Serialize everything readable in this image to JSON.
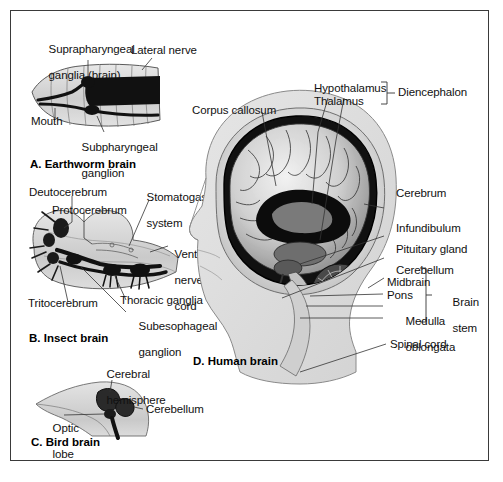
{
  "figure": {
    "title_note": "Comparative brain anatomy across four species",
    "background_color": "#ffffff",
    "border_color": "#3a3a3a"
  },
  "panels": {
    "earthworm": {
      "caption": "A. Earthworm brain",
      "labels": {
        "suprapharyngeal_line1": "Suprapharyngeal",
        "suprapharyngeal_line2": "ganglia (brain)",
        "lateral_nerve": "Lateral nerve",
        "mouth": "Mouth",
        "subpharyngeal_line1": "Subpharyngeal",
        "subpharyngeal_line2": "ganglion"
      }
    },
    "insect": {
      "caption": "B. Insect brain",
      "labels": {
        "deutocerebrum": "Deutocerebrum",
        "protocerebrum": "Protocerebrum",
        "stomatogastric_line1": "Stomatogastric",
        "stomatogastric_line2": "system",
        "ventral_line1": "Ventral",
        "ventral_line2": "nerve",
        "ventral_line3": "cord",
        "tritocerebrum": "Tritocerebrum",
        "thoracic_ganglia": "Thoracic ganglia",
        "subesophageal_line1": "Subesophageal",
        "subesophageal_line2": "ganglion"
      }
    },
    "bird": {
      "caption": "C. Bird brain",
      "labels": {
        "cerebral_line1": "Cerebral",
        "cerebral_line2": "hemisphere",
        "cerebellum": "Cerebellum",
        "optic_line1": "Optic",
        "optic_line2": "lobe"
      }
    },
    "human": {
      "caption": "D. Human brain",
      "labels": {
        "corpus_callosum": "Corpus callosum",
        "hypothalamus": "Hypothalamus",
        "thalamus": "Thalamus",
        "diencephalon": "Diencephalon",
        "cerebrum": "Cerebrum",
        "infundibulum": "Infundibulum",
        "pituitary_gland": "Pituitary gland",
        "cerebellum": "Cerebellum",
        "midbrain": "Midbrain",
        "pons": "Pons",
        "medulla_line1": "Medulla",
        "medulla_line2": "oblongata",
        "brain_stem_line1": "Brain",
        "brain_stem_line2": "stem",
        "spinal_cord": "Spinal cord"
      }
    }
  }
}
